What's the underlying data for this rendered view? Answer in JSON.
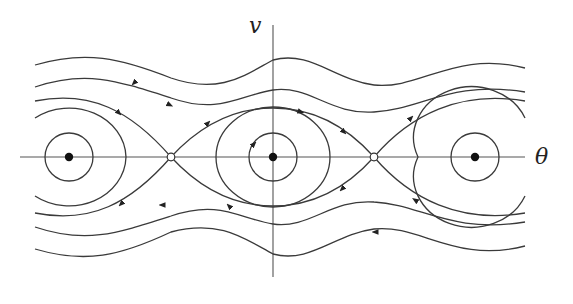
{
  "figure": {
    "type": "phase_portrait",
    "axes": {
      "x_label": "θ",
      "y_label": "v"
    },
    "fixed_points": {
      "centers": [
        {
          "x": 69,
          "y": 157,
          "style": "filled"
        },
        {
          "x": 273,
          "y": 157,
          "style": "filled"
        },
        {
          "x": 475,
          "y": 157,
          "style": "filled"
        }
      ],
      "saddles": [
        {
          "x": 171,
          "y": 157,
          "style": "open"
        },
        {
          "x": 374,
          "y": 157,
          "style": "open"
        }
      ]
    },
    "colors": {
      "line": "#3a3a3a",
      "axis": "#555555",
      "background": "#ffffff"
    }
  }
}
